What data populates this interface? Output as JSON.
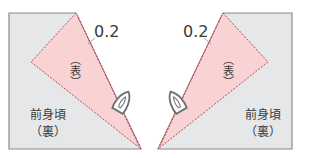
{
  "colors": {
    "fabric_back": "#e6e7e8",
    "fabric_edge": "#8a8a8a",
    "facing_fill": "#f9d3d3",
    "stitch": "#b04a5a",
    "text": "#3a3a3a"
  },
  "left_panel": {
    "measurement": "0.2",
    "facing_label": "（表）",
    "body_label_line1": "前身頃",
    "body_label_line2": "（裏）",
    "icon": "iron-icon"
  },
  "right_panel": {
    "measurement": "0.2",
    "facing_label": "（表）",
    "body_label_line1": "前身頃",
    "body_label_line2": "（裏）",
    "icon": "iron-icon"
  }
}
